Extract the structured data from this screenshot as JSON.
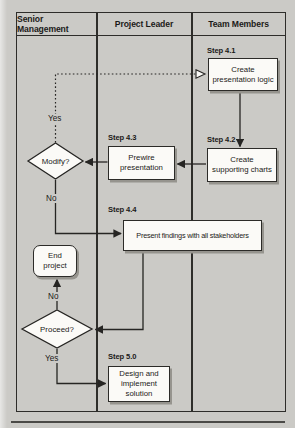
{
  "document": {
    "type": "swimlane-flowchart",
    "bottom_rule": true
  },
  "lanes": [
    "Senior Management",
    "Project Leader",
    "Team Members"
  ],
  "steps": {
    "s4_1": "Step 4.1",
    "s4_2": "Step 4.2",
    "s4_3": "Step 4.3",
    "s4_4": "Step 4.4",
    "s5_0": "Step 5.0"
  },
  "boxes": {
    "create_logic": {
      "lines": [
        "Create",
        "presentation logic"
      ]
    },
    "create_charts": {
      "lines": [
        "Create",
        "supporting charts"
      ]
    },
    "prewire": {
      "lines": [
        "Prewire",
        "presentation"
      ]
    },
    "present_findings": {
      "lines": [
        "Present findings with all stakeholders"
      ]
    },
    "end_project": {
      "lines": [
        "End",
        "project"
      ]
    },
    "design_solution": {
      "lines": [
        "Design and",
        "implement",
        "solution"
      ]
    }
  },
  "decisions": {
    "modify": "Modify?",
    "proceed": "Proceed?"
  },
  "edge_labels": {
    "modify_yes": "Yes",
    "modify_no": "No",
    "proceed_no": "No",
    "proceed_yes": "Yes"
  },
  "colors": {
    "page_bg": "#cbcac6",
    "line": "#262523",
    "box_bg": "#fbfaf7",
    "box_shadow": "#96948e",
    "text": "#1b1a18"
  }
}
